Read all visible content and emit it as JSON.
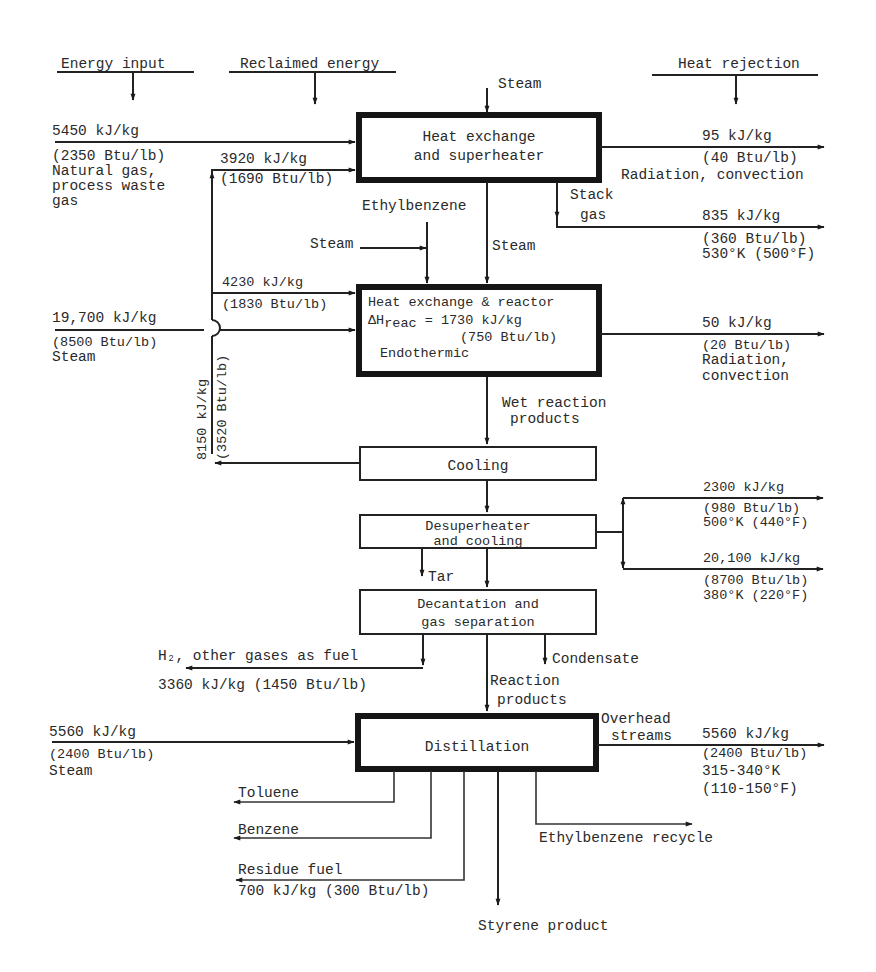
{
  "headers": {
    "energy_input": "Energy input",
    "reclaimed_energy": "Reclaimed energy",
    "heat_rejection": "Heat rejection"
  },
  "units": {
    "heat_exchange_superheater": {
      "line1": "Heat exchange",
      "line2": "and superheater"
    },
    "reactor": {
      "line1": "Heat exchange & reactor",
      "line2_prefix": "ΔH",
      "line2_sub": "reac",
      "line2_rest": " = 1730 kJ/kg",
      "line3": "(750 Btu/lb)",
      "line4": "Endothermic"
    },
    "cooling": {
      "label": "Cooling"
    },
    "desuperheater": {
      "line1": "Desuperheater",
      "line2": "and cooling"
    },
    "decantation": {
      "line1": "Decantation and",
      "line2": "gas separation"
    },
    "distillation": {
      "label": "Distillation"
    }
  },
  "inputs": {
    "fuel": {
      "kj": "5450 kJ/kg",
      "btu": "(2350 Btu/lb)",
      "desc1": "Natural gas,",
      "desc2": "process waste",
      "desc3": "gas"
    },
    "reclaimed_superheater": {
      "kj": "3920 kJ/kg",
      "btu": "(1690 Btu/lb)"
    },
    "reclaimed_reactor": {
      "kj": "4230 kJ/kg",
      "btu": "(1830 Btu/lb)"
    },
    "reactor_steam": {
      "kj": "19,700 kJ/kg",
      "btu": "(8500 Btu/lb)",
      "desc": "Steam"
    },
    "reclaimed_cooling": {
      "kj": "8150 kJ/kg",
      "btu": "(3520 Btu/lb)"
    },
    "distillation_steam": {
      "kj": "5560 kJ/kg",
      "btu": "(2400 Btu/lb)",
      "desc": "Steam"
    }
  },
  "streams": {
    "steam_top": "Steam",
    "ethylbenzene": "Ethylbenzene",
    "steam_side": "Steam",
    "steam_mid": "Steam",
    "stack_gas_1": "Stack",
    "stack_gas_2": "gas",
    "wet_products_1": "Wet reaction",
    "wet_products_2": "products",
    "tar": "Tar",
    "condensate": "Condensate",
    "reaction_products_1": "Reaction",
    "reaction_products_2": "products",
    "overhead_1": "Overhead",
    "overhead_2": "streams",
    "h2_fuel": "H₂, other gases as fuel",
    "h2_value": "3360 kJ/kg (1450 Btu/lb)",
    "toluene": "Toluene",
    "benzene": "Benzene",
    "residue_fuel": "Residue fuel",
    "residue_value": "700 kJ/kg (300 Btu/lb)",
    "ethylbenzene_recycle": "Ethylbenzene recycle",
    "styrene_product": "Styrene product"
  },
  "rejections": {
    "superheater_loss": {
      "kj": "95 kJ/kg",
      "btu": "(40 Btu/lb)",
      "desc": "Radiation, convection"
    },
    "stack_gas": {
      "kj": "835 kJ/kg",
      "btu": "(360 Btu/lb)",
      "temp": "530°K (500°F)"
    },
    "reactor_loss": {
      "kj": "50 kJ/kg",
      "btu": "(20 Btu/lb)",
      "desc1": "Radiation,",
      "desc2": "convection"
    },
    "desuper_hot": {
      "kj": "2300 kJ/kg",
      "btu": "(980 Btu/lb)",
      "temp": "500°K (440°F)"
    },
    "desuper_cold": {
      "kj": "20,100 kJ/kg",
      "btu": "(8700 Btu/lb)",
      "temp": "380°K (220°F)"
    },
    "overhead": {
      "kj": "5560 kJ/kg",
      "btu": "(2400 Btu/lb)",
      "temp1": "315-340°K",
      "temp2": "(110-150°F)"
    }
  }
}
